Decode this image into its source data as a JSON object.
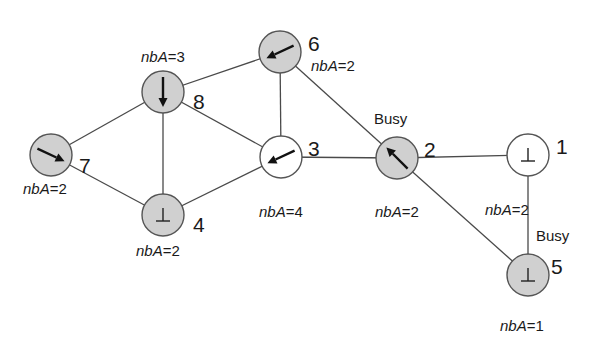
{
  "diagram": {
    "colors": {
      "node_shaded": "#d0d0d0",
      "node_unshaded": "#ffffff",
      "edge": "#4a4a4a",
      "text": "#1a1a1a"
    },
    "nodes": [
      {
        "id": "1",
        "label": "1",
        "x": 528,
        "y": 155,
        "shaded": false,
        "pointer": "perp",
        "nba": "nbA=2",
        "nba_pos": [
          485,
          215
        ],
        "id_pos": [
          556,
          146
        ],
        "busy": "",
        "busy_pos": null
      },
      {
        "id": "2",
        "label": "2",
        "x": 397,
        "y": 158,
        "shaded": true,
        "pointer": "arrow",
        "arrow_angle": -135,
        "nba": "nbA=2",
        "nba_pos": [
          375,
          217
        ],
        "id_pos": [
          424,
          149
        ],
        "busy": "Busy",
        "busy_pos": [
          374,
          124
        ]
      },
      {
        "id": "3",
        "label": "3",
        "x": 281,
        "y": 157,
        "shaded": false,
        "pointer": "arrow",
        "arrow_angle": 155,
        "nba": "nbA=4",
        "nba_pos": [
          259,
          217
        ],
        "id_pos": [
          308,
          148
        ],
        "busy": "",
        "busy_pos": null
      },
      {
        "id": "4",
        "label": "4",
        "x": 163,
        "y": 215,
        "shaded": true,
        "pointer": "perp",
        "nba": "nbA=2",
        "nba_pos": [
          136,
          256
        ],
        "id_pos": [
          193,
          224
        ],
        "busy": "",
        "busy_pos": null
      },
      {
        "id": "5",
        "label": "5",
        "x": 528,
        "y": 275,
        "shaded": true,
        "pointer": "perp",
        "nba": "nbA=1",
        "nba_pos": [
          500,
          331
        ],
        "id_pos": [
          551,
          266
        ],
        "busy": "Busy",
        "busy_pos": [
          536,
          241
        ]
      },
      {
        "id": "6",
        "label": "6",
        "x": 280,
        "y": 52,
        "shaded": true,
        "pointer": "arrow",
        "arrow_angle": 155,
        "nba": "nbA=2",
        "nba_pos": [
          311,
          71
        ],
        "id_pos": [
          308,
          43
        ],
        "busy": "",
        "busy_pos": null
      },
      {
        "id": "7",
        "label": "7",
        "x": 51,
        "y": 155,
        "shaded": true,
        "pointer": "arrow",
        "arrow_angle": 25,
        "nba": "nbA=2",
        "nba_pos": [
          23,
          194
        ],
        "id_pos": [
          79,
          165
        ],
        "busy": "",
        "busy_pos": null
      },
      {
        "id": "8",
        "label": "8",
        "x": 163,
        "y": 92,
        "shaded": true,
        "pointer": "arrow",
        "arrow_angle": 90,
        "nba": "nbA=3",
        "nba_pos": [
          141,
          62
        ],
        "id_pos": [
          193,
          101
        ],
        "busy": "",
        "busy_pos": null
      }
    ],
    "edges": [
      [
        "7",
        "8"
      ],
      [
        "7",
        "4"
      ],
      [
        "8",
        "4"
      ],
      [
        "8",
        "6"
      ],
      [
        "8",
        "3"
      ],
      [
        "6",
        "3"
      ],
      [
        "6",
        "2"
      ],
      [
        "4",
        "3"
      ],
      [
        "3",
        "2"
      ],
      [
        "2",
        "1"
      ],
      [
        "2",
        "5"
      ],
      [
        "1",
        "5"
      ]
    ],
    "node_radius": 21
  }
}
